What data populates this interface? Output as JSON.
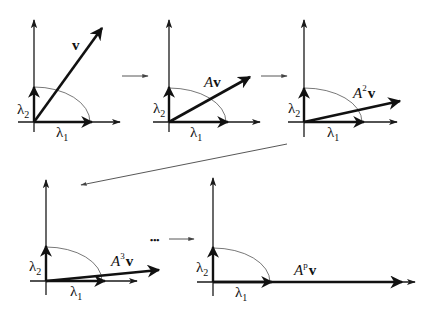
{
  "diagram": {
    "panels": [
      {
        "id": "p1",
        "vector_label": {
          "prefix": "",
          "power": "",
          "bold": "v"
        }
      },
      {
        "id": "p2",
        "vector_label": {
          "prefix": "A",
          "power": "",
          "bold": "v"
        }
      },
      {
        "id": "p3",
        "vector_label": {
          "prefix": "A",
          "power": "2",
          "bold": "v"
        }
      },
      {
        "id": "p4",
        "vector_label": {
          "prefix": "A",
          "power": "3",
          "bold": "v"
        }
      },
      {
        "id": "p5",
        "vector_label": {
          "prefix": "A",
          "power": "p",
          "bold": "v"
        }
      }
    ],
    "eigen_labels": {
      "lambda1": {
        "symbol": "λ",
        "sub": "1"
      },
      "lambda2": {
        "symbol": "λ",
        "sub": "2"
      }
    },
    "ellipsis": "•••",
    "colors": {
      "ink": "#111111",
      "arc": "#555555",
      "background": "#ffffff"
    }
  }
}
